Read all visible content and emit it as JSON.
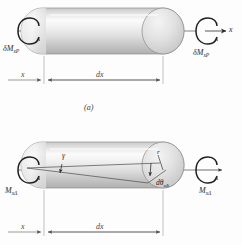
{
  "figure": {
    "type": "engineering-mechanics-diagram",
    "background_color": "#fdfdfd",
    "line_color": "#3a3a3a",
    "cylinder_fill_light": "#fefefe",
    "cylinder_fill_mid": "#dcdcdc",
    "cylinder_fill_dark": "#b4b4b4"
  },
  "panel_a": {
    "letter": "(a)",
    "moment_left": {
      "symbol": "δM",
      "subscript": "xP"
    },
    "moment_right": {
      "symbol": "δM",
      "subscript": "xP"
    },
    "axis_label": "x",
    "dimension_x": "x",
    "dimension_dx": "dx"
  },
  "panel_b": {
    "moment_left": {
      "symbol": "M",
      "subscript": "xΔ"
    },
    "moment_right": {
      "symbol": "M",
      "subscript": "xΔ"
    },
    "shear_angle": "γ",
    "radius_label": "r",
    "twist_angle": {
      "symbol": "dθ",
      "subscript": "xΔ"
    },
    "dimension_x": "x",
    "dimension_dx": "dx"
  },
  "icons": {
    "torque_arrow": "curved-rotation-arrow",
    "axis_arrow": "straight-arrow-right",
    "dimension_arrow": "double-ended-dimension-arrow"
  }
}
